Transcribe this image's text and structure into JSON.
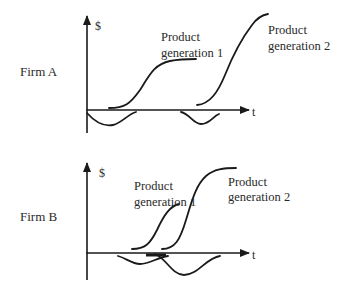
{
  "panels": [
    {
      "firm_label": "Firm A",
      "y_axis_label": "$",
      "x_axis_label": "t",
      "gen1_label_line1": "Product",
      "gen1_label_line2": "generation 1",
      "gen2_label_line1": "Product",
      "gen2_label_line2": "generation 2"
    },
    {
      "firm_label": "Firm B",
      "y_axis_label": "$",
      "x_axis_label": "t",
      "gen1_label_line1": "Product",
      "gen1_label_line2": "generation 1",
      "gen2_label_line1": "Product",
      "gen2_label_line2": "generation 2"
    }
  ],
  "colors": {
    "line": "#1a1a1a",
    "text": "#2a2a2a",
    "background": "#ffffff"
  }
}
